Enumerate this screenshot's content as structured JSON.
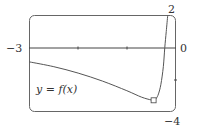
{
  "chart_data": {
    "type": "line",
    "title": "",
    "xlabel": "",
    "ylabel": "",
    "xlim": [
      -3,
      0
    ],
    "ylim": [
      -4,
      2
    ],
    "grid": false,
    "legend": "none",
    "annotations": [
      "y = f(x)"
    ],
    "tick_labels": {
      "x_left": "−3",
      "x_right": "0",
      "y_top": "2",
      "y_bottom": "−4"
    },
    "x_ticks": [
      -2,
      -1
    ],
    "y_ticks": [
      -2
    ],
    "series": [
      {
        "name": "y = f(x)",
        "x": [
          -3.0,
          -2.5,
          -2.0,
          -1.5,
          -1.0,
          -0.7,
          -0.5,
          -0.45,
          -0.4,
          -0.35,
          -0.3,
          -0.25,
          -0.22,
          -0.19,
          -0.16
        ],
        "y": [
          -0.9,
          -1.2,
          -1.6,
          -2.1,
          -2.7,
          -3.1,
          -3.28,
          -3.3,
          -3.2,
          -2.9,
          -2.3,
          -1.2,
          0.0,
          1.0,
          2.0
        ]
      }
    ],
    "marked_point": {
      "x": -0.45,
      "y": -3.3,
      "shape": "square"
    }
  },
  "labels": {
    "x_left": "−3",
    "x_right": "0",
    "y_top": "2",
    "y_bottom": "−4",
    "function": "y = f(x)"
  }
}
